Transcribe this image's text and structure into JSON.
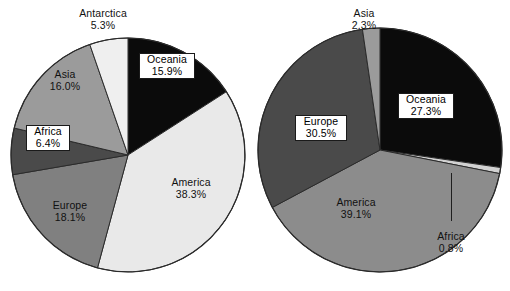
{
  "figure": {
    "background": "#ffffff",
    "text_color": "#111111",
    "panels": [
      "left",
      "right"
    ]
  },
  "palette": {
    "black": "#0b0b0b",
    "very_light_gray": "#e9e9e9",
    "light_gray": "#d2d2d2",
    "medium_light_gray": "#9b9b9b",
    "medium_gray": "#808080",
    "dark_gray": "#4a4a4a",
    "outline": "#2b2b2b",
    "label_box_bg": "#ffffff",
    "label_box_border": "#1a1a1a",
    "leader_line": "#1f1f1f"
  },
  "chart_data": [
    {
      "type": "pie",
      "id": "left-pie",
      "title": "",
      "start_angle_deg": 0,
      "direction": "clockwise",
      "total": 100.0,
      "categories": [
        "Oceania",
        "America",
        "Europe",
        "Africa",
        "Asia",
        "Antarctica"
      ],
      "values": [
        15.9,
        38.3,
        18.1,
        6.4,
        16.0,
        5.3
      ],
      "slices": [
        {
          "label": "Oceania",
          "value": 15.9,
          "value_text": "15.9%",
          "color": "#0b0b0b",
          "boxed": true,
          "label_placement": "inside"
        },
        {
          "label": "America",
          "value": 38.3,
          "value_text": "38.3%",
          "color": "#e9e9e9",
          "boxed": false,
          "label_placement": "inside"
        },
        {
          "label": "Europe",
          "value": 18.1,
          "value_text": "18.1%",
          "color": "#808080",
          "boxed": false,
          "label_placement": "inside"
        },
        {
          "label": "Africa",
          "value": 6.4,
          "value_text": "6.4%",
          "color": "#4a4a4a",
          "boxed": true,
          "label_placement": "inside"
        },
        {
          "label": "Asia",
          "value": 16.0,
          "value_text": "16.0%",
          "color": "#9b9b9b",
          "boxed": false,
          "label_placement": "inside"
        },
        {
          "label": "Antarctica",
          "value": 5.3,
          "value_text": "5.3%",
          "color": "#efefef",
          "boxed": false,
          "label_placement": "outside-top"
        }
      ]
    },
    {
      "type": "pie",
      "id": "right-pie",
      "title": "",
      "start_angle_deg": 0,
      "direction": "clockwise",
      "total": 99.99999999999999,
      "categories": [
        "Oceania",
        "Africa",
        "America",
        "Europe",
        "Asia"
      ],
      "values": [
        27.3,
        0.8,
        39.1,
        30.5,
        2.3
      ],
      "slices": [
        {
          "label": "Oceania",
          "value": 27.3,
          "value_text": "27.3%",
          "color": "#0b0b0b",
          "boxed": true,
          "label_placement": "inside"
        },
        {
          "label": "Africa",
          "value": 0.8,
          "value_text": "0.8%",
          "color": "#d2d2d2",
          "boxed": false,
          "label_placement": "outside-leader"
        },
        {
          "label": "America",
          "value": 39.1,
          "value_text": "39.1%",
          "color": "#8c8c8c",
          "boxed": false,
          "label_placement": "inside"
        },
        {
          "label": "Europe",
          "value": 30.5,
          "value_text": "30.5%",
          "color": "#4a4a4a",
          "boxed": true,
          "label_placement": "inside"
        },
        {
          "label": "Asia",
          "value": 2.3,
          "value_text": "2.3%",
          "color": "#9b9b9b",
          "boxed": false,
          "label_placement": "outside-top"
        }
      ]
    }
  ],
  "left_labels": {
    "antarctica": {
      "name": "Antarctica",
      "pct": "5.3%"
    },
    "oceania": {
      "name": "Oceania",
      "pct": "15.9%"
    },
    "asia": {
      "name": "Asia",
      "pct": "16.0%"
    },
    "africa": {
      "name": "Africa",
      "pct": "6.4%"
    },
    "europe": {
      "name": "Europe",
      "pct": "18.1%"
    },
    "america": {
      "name": "America",
      "pct": "38.3%"
    }
  },
  "right_labels": {
    "asia": {
      "name": "Asia",
      "pct": "2.3%"
    },
    "oceania": {
      "name": "Oceania",
      "pct": "27.3%"
    },
    "europe": {
      "name": "Europe",
      "pct": "30.5%"
    },
    "america": {
      "name": "America",
      "pct": "39.1%"
    },
    "africa": {
      "name": "Africa",
      "pct": "0.8%"
    }
  }
}
